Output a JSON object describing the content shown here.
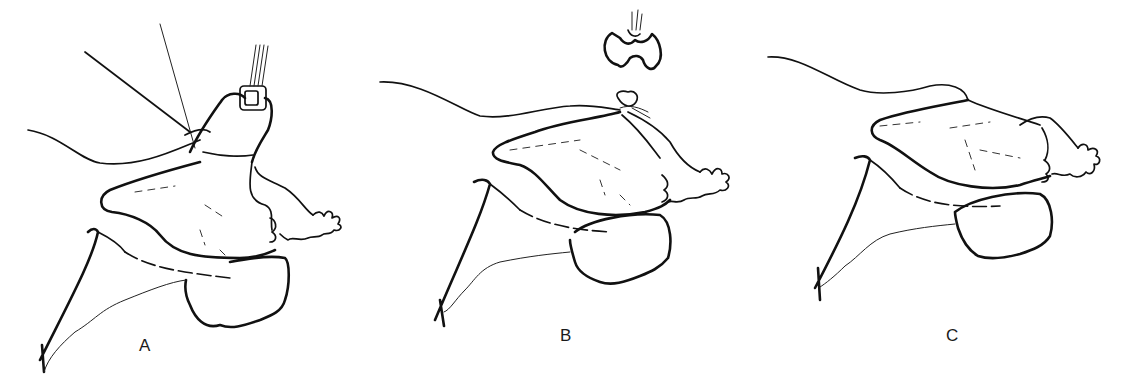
{
  "figure": {
    "panels": [
      {
        "id": "A",
        "label": "A",
        "description": "Clamp applied over tube with ligatures"
      },
      {
        "id": "B",
        "label": "B",
        "description": "Clamp removed, ligature tied"
      },
      {
        "id": "C",
        "label": "C",
        "description": "Final result"
      }
    ],
    "colors": {
      "line": "#111111",
      "background": "#ffffff"
    }
  }
}
